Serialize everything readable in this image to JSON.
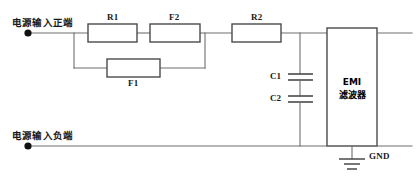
{
  "diagram": {
    "terminals": {
      "positive_label": "电源输入正端",
      "negative_label": "电源输入负端"
    },
    "components": [
      {
        "id": "R1",
        "label": "R1",
        "type": "resistor"
      },
      {
        "id": "F2",
        "label": "F2",
        "type": "fuse"
      },
      {
        "id": "R2",
        "label": "R2",
        "type": "resistor"
      },
      {
        "id": "F1",
        "label": "F1",
        "type": "fuse"
      },
      {
        "id": "C1",
        "label": "C1",
        "type": "capacitor"
      },
      {
        "id": "C2",
        "label": "C2",
        "type": "capacitor"
      }
    ],
    "block": {
      "line1": "EMI",
      "line2": "滤波器"
    },
    "ground": {
      "label": "GND"
    },
    "colors": {
      "wire": "#6f6f6f",
      "outline": "#4a4a4a",
      "text": "#1a1a1a",
      "background": "#ffffff"
    }
  }
}
